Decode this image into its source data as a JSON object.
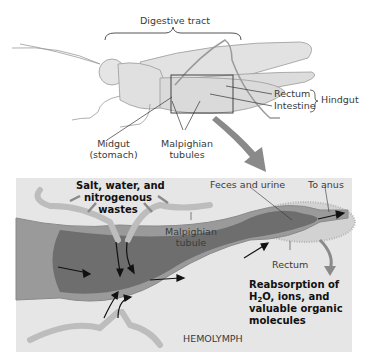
{
  "top": {
    "brace_label": "Digestive tract",
    "labels": {
      "rectum": "Rectum",
      "intestine": "Intestine",
      "hindgut": "Hindgut",
      "midgut_line1": "Midgut",
      "midgut_line2": "(stomach)",
      "malpighian_line1": "Malpighian",
      "malpighian_line2": "tubules"
    }
  },
  "bottom": {
    "panel_color": "#e6e6e6",
    "inputs_line1": "Salt, water, and",
    "inputs_line2": "nitrogenous",
    "inputs_line3": "wastes",
    "feces": "Feces and urine",
    "to_anus": "To anus",
    "tubule_line1": "Malpighian",
    "tubule_line2": "tubule",
    "rectum": "Rectum",
    "reabs_line1": "Reabsorption of",
    "reabs_line2_pre": "H",
    "reabs_line2_sub": "2",
    "reabs_line2_post": "O, ions, and",
    "reabs_line3": "valuable organic",
    "reabs_line4": "molecules",
    "hemolymph": "HEMOLYMPH"
  }
}
